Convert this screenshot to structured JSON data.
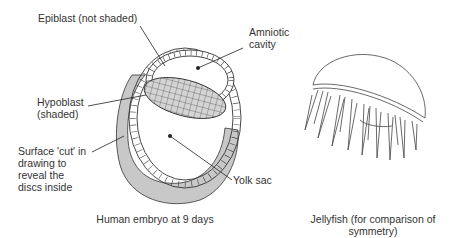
{
  "embryo": {
    "labels": {
      "epiblast": "Epiblast (not shaded)",
      "amniotic_line1": "Amniotic",
      "amniotic_line2": "cavity",
      "hypoblast_line1": "Hypoblast",
      "hypoblast_line2": "(shaded)",
      "cut_line1": "Surface 'cut' in",
      "cut_line2": "drawing to",
      "cut_line3": "reveal the",
      "cut_line4": "discs inside",
      "yolk_sac": "Yolk sac"
    },
    "caption": "Human embryo at 9 days",
    "colors": {
      "shaded": "#c8c8c8",
      "outline": "#333333"
    }
  },
  "jellyfish": {
    "caption_line1": "Jellyfish (for comparison of",
    "caption_line2": "symmetry)"
  }
}
